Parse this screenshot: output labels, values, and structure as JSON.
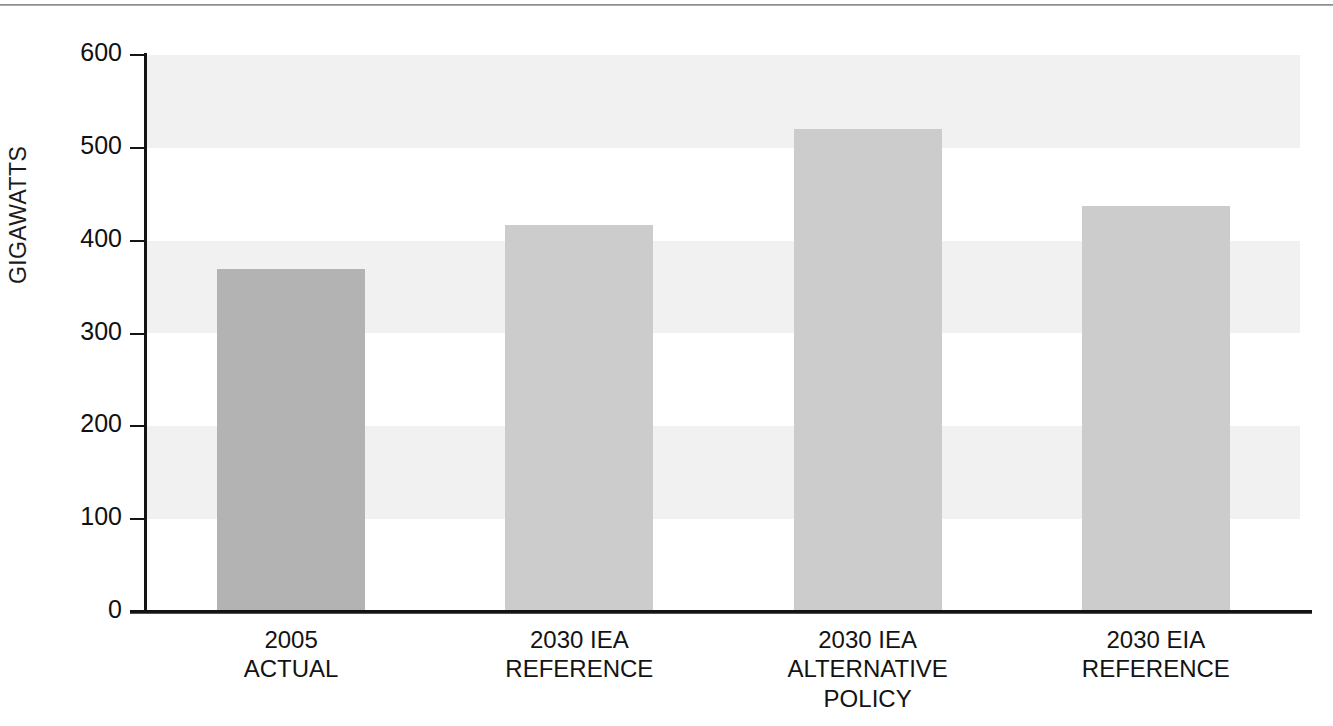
{
  "chart_data": {
    "type": "bar",
    "title": "",
    "subtitle": "",
    "xlabel": "",
    "ylabel": "GIGAWATTS",
    "ylim": [
      0,
      600
    ],
    "ytick_values": [
      0,
      100,
      200,
      300,
      400,
      500,
      600
    ],
    "ytick_labels": [
      "0",
      "100",
      "200",
      "300",
      "400",
      "500",
      "600"
    ],
    "grid": false,
    "banded_background": true,
    "legend": null,
    "categories": [
      "2005\nACTUAL",
      "2030 IEA\nREFERENCE",
      "2030 IEA\nALTERNATIVE\nPOLICY",
      "2030 EIA\nREFERENCE"
    ],
    "values": [
      369,
      417,
      520,
      437
    ],
    "bar_colors": [
      "#b3b3b3",
      "#cccccc",
      "#cccccc",
      "#cccccc"
    ],
    "band_color": "#f1f1f1",
    "axis_color": "#141414",
    "text_color": "#131313"
  },
  "axis": {
    "y_title": "GIGAWATTS"
  },
  "ticks": [
    {
      "label": "600",
      "value": 600
    },
    {
      "label": "500",
      "value": 500
    },
    {
      "label": "400",
      "value": 400
    },
    {
      "label": "300",
      "value": 300
    },
    {
      "label": "200",
      "value": 200
    },
    {
      "label": "100",
      "value": 100
    },
    {
      "label": "0",
      "value": 0
    }
  ],
  "bars": [
    {
      "label": "2005\nACTUAL",
      "value": 369,
      "color": "#b3b3b3"
    },
    {
      "label": "2030 IEA\nREFERENCE",
      "value": 417,
      "color": "#cccccc"
    },
    {
      "label": "2030 IEA\nALTERNATIVE\nPOLICY",
      "value": 520,
      "color": "#cccccc"
    },
    {
      "label": "2030 EIA\nREFERENCE",
      "value": 437,
      "color": "#cccccc"
    }
  ]
}
